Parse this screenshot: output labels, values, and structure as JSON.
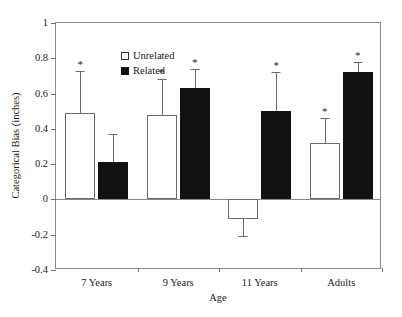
{
  "chart_data": {
    "type": "bar",
    "title": "",
    "xlabel": "Age",
    "ylabel": "Categorical Bias (inches)",
    "categories": [
      "7 Years",
      "9 Years",
      "11 Years",
      "Adults"
    ],
    "ylim": [
      -0.4,
      1
    ],
    "ytick_labels": [
      "1",
      "0.8",
      "0.6",
      "0.4",
      "0.2",
      "0",
      "-0.2",
      "-0.4"
    ],
    "ytick_values": [
      1,
      0.8,
      0.6,
      0.4,
      0.2,
      0,
      -0.2,
      -0.4
    ],
    "grid": false,
    "legend_position": "top-left",
    "series": [
      {
        "name": "Unrelated",
        "fill": "#ffffff",
        "values": [
          0.49,
          0.48,
          -0.11,
          0.32
        ],
        "errors": [
          0.24,
          0.2,
          0.1,
          0.14
        ],
        "significance": [
          "*",
          "*",
          "",
          "*"
        ]
      },
      {
        "name": "Related",
        "fill": "#111111",
        "values": [
          0.21,
          0.63,
          0.5,
          0.72
        ],
        "errors": [
          0.16,
          0.11,
          0.22,
          0.06
        ],
        "significance": [
          "",
          "*",
          "*",
          "*"
        ]
      }
    ]
  }
}
